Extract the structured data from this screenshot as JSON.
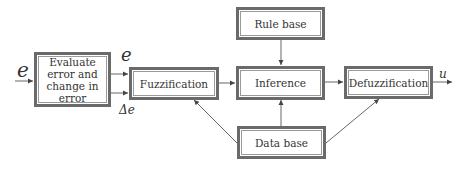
{
  "diagram": {
    "blocks": {
      "evaluate": "Evaluate error and change in error",
      "evaluate_lines": [
        "Evaluate",
        "error and",
        "change in",
        "error"
      ],
      "fuzzification": "Fuzzification",
      "rule_base": "Rule base",
      "inference": "Inference",
      "defuzzification": "Defuzzification",
      "data_base": "Data base"
    },
    "signals": {
      "input": "e",
      "error_out": "e",
      "delta_error": "Δe",
      "output": "u"
    },
    "edges": [
      {
        "from": "input",
        "to": "evaluate",
        "label": "e"
      },
      {
        "from": "evaluate",
        "to": "fuzzification",
        "label": "e"
      },
      {
        "from": "evaluate",
        "to": "fuzzification",
        "label": "Δe"
      },
      {
        "from": "fuzzification",
        "to": "inference"
      },
      {
        "from": "rule_base",
        "to": "inference"
      },
      {
        "from": "inference",
        "to": "defuzzification"
      },
      {
        "from": "defuzzification",
        "to": "output",
        "label": "u"
      },
      {
        "from": "data_base",
        "to": "fuzzification"
      },
      {
        "from": "data_base",
        "to": "inference"
      },
      {
        "from": "data_base",
        "to": "defuzzification"
      }
    ],
    "colors": {
      "border": "#6a6a6a",
      "line": "#555555",
      "text": "#333333"
    }
  }
}
